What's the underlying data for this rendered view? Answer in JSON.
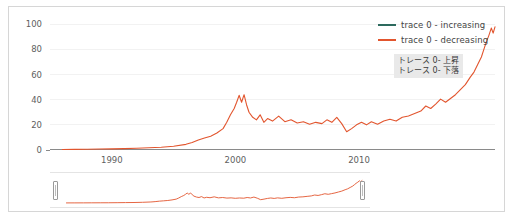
{
  "chart_data": {
    "type": "line",
    "title": "",
    "xlabel": "",
    "ylabel": "",
    "xlim": [
      1985,
      2021
    ],
    "ylim": [
      0,
      105
    ],
    "grid": false,
    "legend_position": "top-right",
    "x_ticks": [
      "1990",
      "2000",
      "2010"
    ],
    "x_tick_values": [
      1990,
      2000,
      2010
    ],
    "y_ticks": [
      "0",
      "20",
      "40",
      "60",
      "80",
      "100"
    ],
    "y_tick_values": [
      0,
      20,
      40,
      60,
      80,
      100
    ],
    "series": [
      {
        "name": "trace 0 - increasing",
        "color": "#2d6a5e",
        "visible_in_plot": false,
        "values": []
      },
      {
        "name": "trace 0 - decreasing",
        "color": "#e2552e",
        "visible_in_plot": true,
        "x": [
          1986,
          1987,
          1988,
          1989,
          1990,
          1991,
          1992,
          1993,
          1994,
          1995,
          1996,
          1996.5,
          1997,
          1997.5,
          1998,
          1998.5,
          1999,
          1999.3,
          1999.6,
          1999.9,
          2000.1,
          2000.3,
          2000.5,
          2000.7,
          2000.9,
          2001.1,
          2001.4,
          2001.7,
          2002,
          2002.3,
          2002.6,
          2003,
          2003.5,
          2004,
          2004.5,
          2005,
          2005.5,
          2006,
          2006.5,
          2007,
          2007.4,
          2007.8,
          2008.2,
          2008.6,
          2009,
          2009.4,
          2009.8,
          2010.2,
          2010.6,
          2011,
          2011.5,
          2012,
          2012.5,
          2013,
          2013.5,
          2014,
          2014.5,
          2015,
          2015.4,
          2015.8,
          2016.2,
          2016.6,
          2017,
          2017.4,
          2017.8,
          2018.2,
          2018.6,
          2019,
          2019.3,
          2019.6,
          2019.9,
          2020.1,
          2020.3,
          2020.5,
          2020.7,
          2020.85,
          2021
        ],
        "values": [
          0.4,
          0.5,
          0.6,
          0.8,
          0.9,
          1.1,
          1.4,
          1.8,
          2.2,
          3.0,
          4.5,
          6.0,
          8.0,
          9.5,
          11.0,
          13.5,
          17.0,
          22.0,
          28.0,
          33.0,
          38.0,
          43.5,
          38.0,
          44.0,
          36.0,
          30.0,
          26.0,
          24.0,
          28.0,
          22.0,
          25.0,
          23.0,
          27.0,
          22.5,
          24.0,
          21.5,
          22.5,
          20.5,
          22.0,
          21.0,
          24.0,
          22.0,
          26.0,
          21.0,
          14.5,
          17.0,
          20.0,
          22.0,
          20.0,
          22.5,
          20.5,
          23.0,
          24.5,
          23.0,
          26.0,
          27.0,
          29.0,
          31.0,
          35.0,
          33.0,
          36.5,
          40.5,
          38.0,
          41.0,
          44.0,
          48.0,
          52.0,
          58.0,
          62.0,
          68.0,
          74.0,
          80.0,
          86.0,
          91.0,
          97.0,
          93.0,
          98.0
        ]
      }
    ]
  },
  "legend": {
    "entries": [
      {
        "label": "trace 0 - increasing",
        "color": "#2d6a5e"
      },
      {
        "label": "trace 0 - decreasing",
        "color": "#e2552e"
      }
    ]
  },
  "hover_box": {
    "lines": [
      "トレース 0- 上昇",
      "トレース 0- 下落"
    ]
  },
  "rangeslider": {
    "left_handle_label": "range-slider-left-handle",
    "right_handle_label": "range-slider-right-handle"
  },
  "axes": {
    "y_tick_labels": [
      "100",
      "80",
      "60",
      "40",
      "20",
      "0"
    ],
    "x_tick_labels": [
      "1990",
      "2000",
      "2010"
    ]
  }
}
